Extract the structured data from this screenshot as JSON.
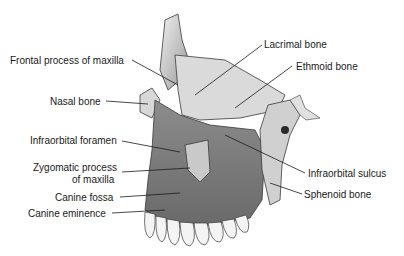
{
  "diagram": {
    "labels": {
      "frontal_process": "Frontal process of maxilla",
      "nasal_bone": "Nasal bone",
      "infraorbital_foramen": "Infraorbital foramen",
      "zygomatic_process_line1": "Zygomatic process",
      "zygomatic_process_line2": "of maxilla",
      "canine_fossa": "Canine fossa",
      "canine_eminence": "Canine eminence",
      "lacrimal_bone": "Lacrimal bone",
      "ethmoid_bone": "Ethmoid bone",
      "infraorbital_sulcus": "Infraorbital sulcus",
      "sphenoid_bone": "Sphenoid bone"
    },
    "colors": {
      "bone_light": "#e6e6e6",
      "bone_mid": "#a8a8a8",
      "bone_dark": "#5a5a5a",
      "outline": "#3a3a3a",
      "leader": "#1a1a1a"
    }
  }
}
